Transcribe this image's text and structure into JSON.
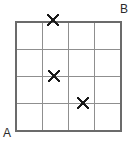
{
  "figure": {
    "width": 134,
    "height": 141,
    "background_color": "#ffffff"
  },
  "grid": {
    "columns": 4,
    "rows": 4,
    "left": 16,
    "top": 22,
    "right": 121,
    "bottom": 131,
    "cell_width": 26.25,
    "cell_height": 27.25,
    "border_color": "#6b6b6b",
    "border_width": 1.4,
    "inner_line_color": "#8f8f8f",
    "inner_line_width": 1.0,
    "vertical_lines": [
      16,
      42.25,
      68.5,
      94.75,
      121
    ],
    "horizontal_lines": [
      22,
      49.25,
      76.5,
      103.75,
      131
    ]
  },
  "labels": {
    "bottom_left": "A",
    "top_right": "B",
    "color": "#2b2b2b",
    "font_size": 12
  },
  "markers": {
    "glyph": "x-mark",
    "color": "#1a1a1a",
    "stroke_width": 2.1,
    "arm_length": 5.2,
    "items": [
      {
        "name": "x-marker-1",
        "cx": 53,
        "cy": 20,
        "column": 2,
        "row_edge": "top",
        "label": "X"
      },
      {
        "name": "x-marker-2",
        "cx": 54,
        "cy": 76,
        "column": 2,
        "row_edge": "line-3",
        "label": "X"
      },
      {
        "name": "x-marker-3",
        "cx": 83,
        "cy": 103,
        "column": 3,
        "row_edge": "line-4",
        "label": "X"
      }
    ]
  }
}
